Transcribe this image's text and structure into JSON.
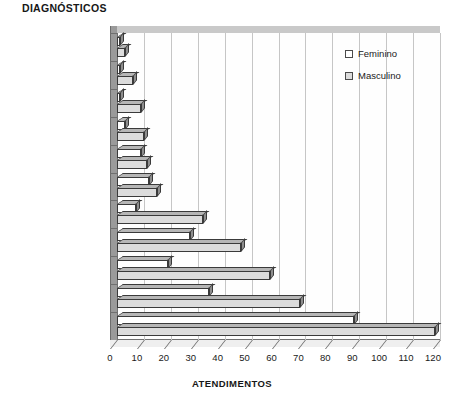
{
  "chart_data": {
    "type": "bar",
    "orientation": "horizontal",
    "title": "DIAGNÓSTICOS",
    "xlabel": "ATENDIMENTOS",
    "ylabel": "",
    "xlim": [
      0,
      120
    ],
    "xticks": [
      0,
      10,
      20,
      30,
      40,
      50,
      60,
      70,
      80,
      90,
      100,
      110,
      120
    ],
    "grid": true,
    "legend_position": "top-right",
    "categories": [
      "Outros",
      "Embriaguez",
      "Arma de fogo",
      "Forças animadas",
      "Forças inanimadas",
      "Atropelamento",
      "Ciclista",
      "Acidentes",
      "Trânsito",
      "Agressão",
      "Quedas"
    ],
    "series": [
      {
        "name": "Feminino",
        "color": "#ffffff",
        "values": [
          1,
          1,
          1,
          3,
          9,
          12,
          7,
          27,
          19,
          34,
          88
        ]
      },
      {
        "name": "Masculino",
        "color": "#dcdcdc",
        "values": [
          3,
          6,
          9,
          10,
          11,
          15,
          32,
          46,
          57,
          68,
          118
        ]
      }
    ]
  },
  "legend": {
    "items": [
      {
        "label": "Feminino"
      },
      {
        "label": "Masculino"
      }
    ]
  },
  "colors": {
    "series_feminino": "#ffffff",
    "series_masculino": "#dcdcdc",
    "bar_outline": "#3a3a3a",
    "gridline": "#c6c6c6",
    "axis": "#6f6f6f"
  }
}
